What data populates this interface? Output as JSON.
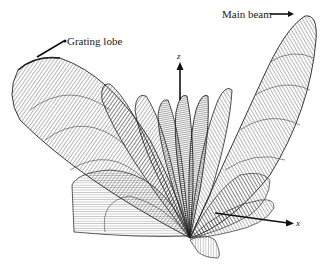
{
  "diagram": {
    "type": "3D antenna radiation pattern",
    "annotations": {
      "main_beam": "Main beam",
      "grating_lobe": "Grating lobe"
    },
    "axes": {
      "z": "z",
      "x": "x"
    },
    "colors": {
      "line": "#2a2a2a",
      "fill": "#ffffff",
      "background": "#ffffff"
    }
  }
}
